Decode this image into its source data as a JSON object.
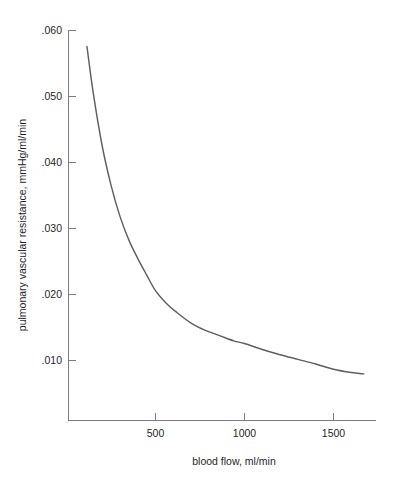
{
  "chart_data": {
    "type": "line",
    "title": "",
    "subtitle": "",
    "xlabel": "blood flow, ml/min",
    "ylabel": "pulmonary vascular resistance, mmHg/ml/min",
    "xlim": [
      115,
      1670
    ],
    "ylim": [
      0.0,
      0.06
    ],
    "grid": false,
    "legend": null,
    "xticks": [
      500,
      1000,
      1500
    ],
    "xticklabels": [
      "500",
      "1000",
      "1500"
    ],
    "yticks": [
      0.01,
      0.02,
      0.03,
      0.04,
      0.05,
      0.06
    ],
    "yticklabels": [
      ".010",
      ".020",
      ".030",
      ".040",
      ".050",
      ".060"
    ],
    "series": [
      {
        "name": "pulmonary vascular resistance",
        "color": "#5f5f5f",
        "x": [
          115,
          150,
          200,
          250,
          300,
          350,
          400,
          450,
          500,
          560,
          620,
          700,
          780,
          860,
          940,
          1000,
          1100,
          1200,
          1300,
          1400,
          1500,
          1600,
          1670
        ],
        "y": [
          0.0575,
          0.0505,
          0.0425,
          0.0365,
          0.0318,
          0.0282,
          0.0254,
          0.0229,
          0.0205,
          0.0186,
          0.0172,
          0.0156,
          0.0145,
          0.0137,
          0.0129,
          0.0125,
          0.0116,
          0.0108,
          0.0101,
          0.0094,
          0.0086,
          0.0081,
          0.0079
        ]
      }
    ],
    "annotations": []
  },
  "axes": {
    "y_axis_label": "pulmonary vascular resistance, mmHg/ml/min",
    "x_axis_label": "blood flow, ml/min",
    "y_tick_labels": [
      ".060",
      ".050",
      ".040",
      ".030",
      ".020",
      ".010"
    ],
    "x_tick_labels": [
      "500",
      "1000",
      "1500"
    ]
  },
  "colors": {
    "curve": "#5f5f5f",
    "axis": "#7d7d7d",
    "text": "#1f1f1f",
    "background": "#ffffff"
  }
}
